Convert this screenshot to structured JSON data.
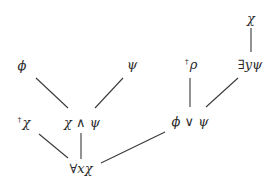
{
  "diagram": {
    "type": "tree",
    "nodes": [
      {
        "id": "chi_top",
        "label": "χ",
        "dagger": "",
        "x": 251,
        "y": 18
      },
      {
        "id": "exists_y_psi",
        "label": "∃yψ",
        "dagger": "",
        "x": 250,
        "y": 64
      },
      {
        "id": "phi",
        "label": "ϕ",
        "dagger": "",
        "x": 22,
        "y": 65
      },
      {
        "id": "psi",
        "label": "ψ",
        "dagger": "",
        "x": 132,
        "y": 64
      },
      {
        "id": "rho",
        "label": "ρ",
        "dagger": "†",
        "x": 191,
        "y": 64
      },
      {
        "id": "chi_dagger",
        "label": "χ",
        "dagger": "†",
        "x": 24,
        "y": 122
      },
      {
        "id": "chi_and_psi",
        "label": "χ ∧ ψ",
        "dagger": "",
        "x": 82,
        "y": 122
      },
      {
        "id": "phi_or_psi",
        "label": "ϕ ∨ ψ",
        "dagger": "",
        "x": 190,
        "y": 121
      },
      {
        "id": "forall_x_chi",
        "label": "∀xχ",
        "dagger": "",
        "x": 81,
        "y": 168
      }
    ],
    "edges": [
      {
        "from": "chi_top",
        "to": "exists_y_psi",
        "x1": 251,
        "y1": 28,
        "x2": 251,
        "y2": 52
      },
      {
        "from": "phi",
        "to": "chi_and_psi",
        "x1": 36,
        "y1": 78,
        "x2": 68,
        "y2": 108
      },
      {
        "from": "psi",
        "to": "chi_and_psi",
        "x1": 123,
        "y1": 78,
        "x2": 95,
        "y2": 108
      },
      {
        "from": "rho",
        "to": "phi_or_psi",
        "x1": 190,
        "y1": 78,
        "x2": 190,
        "y2": 107
      },
      {
        "from": "exists_y_psi",
        "to": "phi_or_psi",
        "x1": 238,
        "y1": 78,
        "x2": 206,
        "y2": 107
      },
      {
        "from": "chi_dagger",
        "to": "forall_x_chi",
        "x1": 39,
        "y1": 134,
        "x2": 68,
        "y2": 158
      },
      {
        "from": "chi_and_psi",
        "to": "forall_x_chi",
        "x1": 81,
        "y1": 133,
        "x2": 81,
        "y2": 159
      },
      {
        "from": "phi_or_psi",
        "to": "forall_x_chi",
        "x1": 165,
        "y1": 132,
        "x2": 101,
        "y2": 163
      }
    ]
  }
}
